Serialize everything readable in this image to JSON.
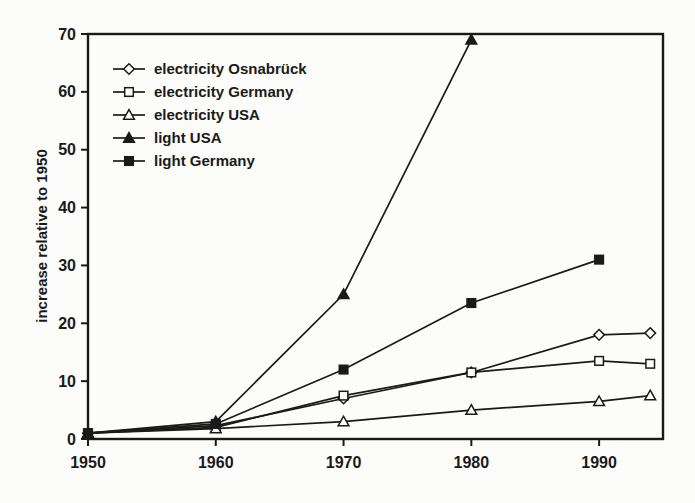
{
  "figure": {
    "background_color": "#fcfcfa",
    "ink_color": "#1a1a1a"
  },
  "chart_data": {
    "type": "line",
    "title": "",
    "xlabel": "",
    "ylabel": "increase relative to 1950",
    "xlim": [
      1950,
      1995
    ],
    "ylim": [
      0,
      70
    ],
    "xticks": [
      "1950",
      "1960",
      "1970",
      "1980",
      "1990"
    ],
    "xtick_values": [
      1950,
      1960,
      1970,
      1980,
      1990
    ],
    "yticks": [
      "0",
      "10",
      "20",
      "30",
      "40",
      "50",
      "60",
      "70"
    ],
    "ytick_values": [
      0,
      10,
      20,
      30,
      40,
      50,
      60,
      70
    ],
    "grid": false,
    "legend_position": "upper-left-inside",
    "line_color": "#1a1a1a",
    "marker_fill_open": "#ffffff",
    "series": [
      {
        "name": "electricity Osnabrück",
        "marker": "diamond-open",
        "x": [
          1950,
          1960,
          1970,
          1980,
          1990,
          1994
        ],
        "y": [
          1,
          2.3,
          7,
          11.5,
          18,
          18.3
        ]
      },
      {
        "name": "electricity Germany",
        "marker": "square-open",
        "x": [
          1950,
          1960,
          1970,
          1980,
          1990,
          1994
        ],
        "y": [
          1,
          2,
          7.5,
          11.5,
          13.5,
          13
        ]
      },
      {
        "name": "electricity USA",
        "marker": "triangle-open",
        "x": [
          1950,
          1960,
          1970,
          1980,
          1990,
          1994
        ],
        "y": [
          1,
          1.8,
          3,
          5,
          6.5,
          7.5
        ]
      },
      {
        "name": "light USA",
        "marker": "triangle-filled",
        "x": [
          1950,
          1960,
          1970,
          1980
        ],
        "y": [
          1,
          3,
          25,
          69
        ]
      },
      {
        "name": "light Germany",
        "marker": "square-filled",
        "x": [
          1950,
          1960,
          1970,
          1980,
          1990
        ],
        "y": [
          1,
          2.6,
          12,
          23.5,
          31
        ]
      }
    ]
  }
}
